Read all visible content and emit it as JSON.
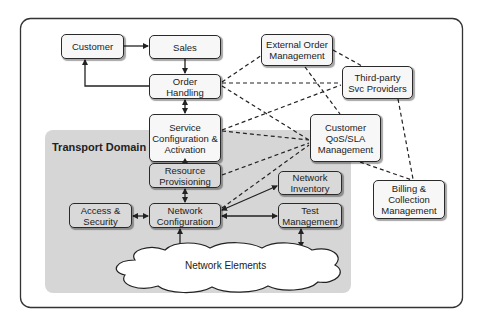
{
  "diagram": {
    "title": "Transport Domain",
    "cloud_label": "Network Elements",
    "nodes": {
      "customer": "Customer",
      "sales": "Sales",
      "order_handling": "Order\nHandling",
      "service_config": "Service\nConfiguration &\nActivation",
      "resource_provisioning": "Resource\nProvisioning",
      "network_configuration": "Network\nConfiguration",
      "access_security": "Access &\nSecurity",
      "network_inventory": "Network\nInventory",
      "test_management": "Test\nManagement",
      "external_order": "External Order\nManagement",
      "third_party": "Third-party\nSvc Providers",
      "customer_qos": "Customer\nQoS/SLA\nManagement",
      "billing": "Billing &\nCollection\nManagement"
    },
    "edges": [
      {
        "from": "customer",
        "to": "sales",
        "style": "solid",
        "arrow": "end"
      },
      {
        "from": "sales",
        "to": "order_handling",
        "style": "solid",
        "arrow": "end"
      },
      {
        "from": "order_handling",
        "to": "customer",
        "style": "solid",
        "arrow": "end"
      },
      {
        "from": "order_handling",
        "to": "service_config",
        "style": "solid",
        "arrow": "both"
      },
      {
        "from": "service_config",
        "to": "resource_provisioning",
        "style": "solid",
        "arrow": "both"
      },
      {
        "from": "resource_provisioning",
        "to": "network_configuration",
        "style": "solid",
        "arrow": "both"
      },
      {
        "from": "access_security",
        "to": "network_configuration",
        "style": "solid",
        "arrow": "both"
      },
      {
        "from": "network_configuration",
        "to": "network_inventory",
        "style": "solid",
        "arrow": "both"
      },
      {
        "from": "network_configuration",
        "to": "test_management",
        "style": "solid",
        "arrow": "both"
      },
      {
        "from": "network_configuration",
        "to": "network_elements",
        "style": "solid",
        "arrow": "both"
      },
      {
        "from": "test_management",
        "to": "network_elements",
        "style": "solid",
        "arrow": "both"
      },
      {
        "from": "order_handling",
        "to": "external_order",
        "style": "dashed"
      },
      {
        "from": "order_handling",
        "to": "third_party",
        "style": "dashed"
      },
      {
        "from": "order_handling",
        "to": "customer_qos",
        "style": "dashed"
      },
      {
        "from": "service_config",
        "to": "third_party",
        "style": "dashed"
      },
      {
        "from": "service_config",
        "to": "customer_qos",
        "style": "dashed"
      },
      {
        "from": "resource_provisioning",
        "to": "customer_qos",
        "style": "dashed"
      },
      {
        "from": "network_configuration",
        "to": "customer_qos",
        "style": "dashed"
      },
      {
        "from": "external_order",
        "to": "third_party",
        "style": "dashed"
      },
      {
        "from": "external_order",
        "to": "customer_qos",
        "style": "dashed"
      },
      {
        "from": "third_party",
        "to": "billing",
        "style": "dashed"
      },
      {
        "from": "customer_qos",
        "to": "billing",
        "style": "dashed"
      }
    ]
  }
}
